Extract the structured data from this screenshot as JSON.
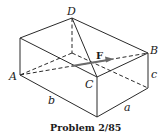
{
  "figure": {
    "caption": "Problem 2/85",
    "vertices": {
      "A": "A",
      "B": "B",
      "C": "C",
      "D": "D"
    },
    "dimensions": {
      "a": "a",
      "b": "b",
      "c": "c"
    },
    "force_label": "F"
  }
}
